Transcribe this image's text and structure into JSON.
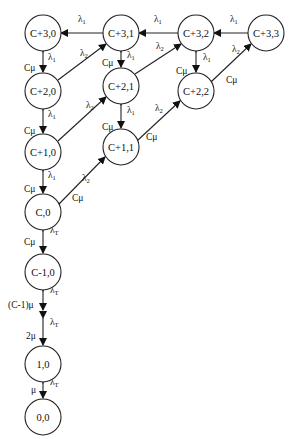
{
  "nodes": {
    "n30": {
      "label": "C+3,0",
      "x": 43,
      "y": 33
    },
    "n31": {
      "label": "C+3,1",
      "x": 121,
      "y": 33
    },
    "n32": {
      "label": "C+3,2",
      "x": 196,
      "y": 33
    },
    "n33": {
      "label": "C+3,3",
      "x": 266,
      "y": 33
    },
    "n20": {
      "label": "C+2,0",
      "x": 43,
      "y": 91
    },
    "n21": {
      "label": "C+2,1",
      "x": 121,
      "y": 86
    },
    "n22": {
      "label": "C+2,2",
      "x": 196,
      "y": 91
    },
    "n10": {
      "label": "C+1,0",
      "x": 43,
      "y": 152
    },
    "n11": {
      "label": "C+1,1",
      "x": 121,
      "y": 147
    },
    "c0": {
      "label": "C,0",
      "x": 43,
      "y": 212
    },
    "cm1": {
      "label": "C-1,0",
      "x": 43,
      "y": 272
    },
    "one": {
      "label": "1,0",
      "x": 43,
      "y": 364
    },
    "zero": {
      "label": "0,0",
      "x": 43,
      "y": 417
    }
  },
  "labels": {
    "lambda": "λ",
    "sub1": "1",
    "sub2": "2",
    "subT": "T",
    "cmu": "Cμ",
    "cm1mu": "(C-1)μ",
    "twomu": "2μ",
    "mu": "μ"
  }
}
